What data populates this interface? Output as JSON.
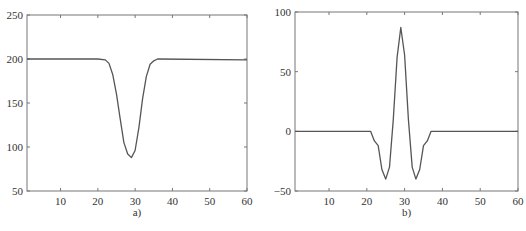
{
  "chart_data": [
    {
      "type": "line",
      "caption": "a)",
      "title": "",
      "xlabel": "",
      "ylabel": "",
      "xlim": [
        1,
        60
      ],
      "ylim": [
        50,
        250
      ],
      "xticks": [
        10,
        20,
        30,
        40,
        50,
        60
      ],
      "yticks": [
        50,
        100,
        150,
        200,
        250
      ],
      "grid": false,
      "series": [
        {
          "name": "profile",
          "x": [
            1,
            20,
            22,
            23,
            24,
            25,
            26,
            27,
            28,
            29,
            30,
            31,
            32,
            33,
            34,
            35,
            36,
            60
          ],
          "y": [
            200,
            200,
            199,
            195,
            182,
            160,
            132,
            105,
            92,
            88,
            96,
            122,
            155,
            180,
            194,
            198,
            200,
            199
          ]
        }
      ]
    },
    {
      "type": "line",
      "caption": "b)",
      "title": "",
      "xlabel": "",
      "ylabel": "",
      "xlim": [
        1,
        60
      ],
      "ylim": [
        -50,
        100
      ],
      "xticks": [
        10,
        20,
        30,
        40,
        50,
        60
      ],
      "yticks": [
        -50,
        0,
        50,
        100
      ],
      "grid": false,
      "series": [
        {
          "name": "second derivative",
          "x": [
            1,
            21,
            22,
            23,
            24,
            25,
            26,
            27,
            28,
            29,
            30,
            31,
            32,
            33,
            34,
            35,
            36,
            37,
            60
          ],
          "y": [
            0,
            0,
            -8,
            -12,
            -32,
            -40,
            -30,
            10,
            62,
            87,
            64,
            10,
            -30,
            -40,
            -32,
            -12,
            -8,
            0,
            0
          ]
        }
      ]
    }
  ],
  "tick_label_text": {
    "a": {
      "x": [
        "10",
        "20",
        "30",
        "40",
        "50",
        "60"
      ],
      "y": [
        "50",
        "100",
        "150",
        "200",
        "250"
      ]
    },
    "b": {
      "x": [
        "10",
        "20",
        "30",
        "40",
        "50",
        "60"
      ],
      "y": [
        "−50",
        "0",
        "50",
        "100"
      ]
    }
  },
  "colors": {
    "line": "#555555",
    "axis": "#777777"
  }
}
